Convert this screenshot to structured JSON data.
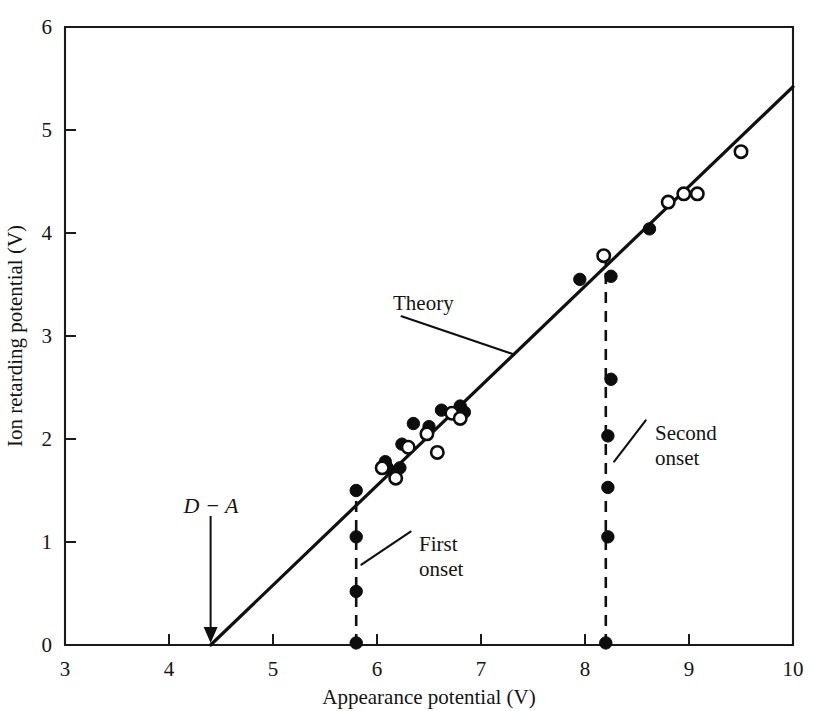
{
  "chart_data": {
    "type": "scatter",
    "title": "",
    "xlabel": "Appearance potential (V)",
    "ylabel": "Ion retarding potential (V)",
    "xlim": [
      3,
      10
    ],
    "ylim": [
      0,
      6
    ],
    "xticks": [
      3,
      4,
      5,
      6,
      7,
      8,
      9,
      10
    ],
    "yticks": [
      0,
      1,
      2,
      3,
      4,
      5,
      6
    ],
    "xtick_labels": [
      "3",
      "4",
      "5",
      "6",
      "7",
      "8",
      "9",
      "10"
    ],
    "ytick_labels": [
      "0",
      "1",
      "2",
      "3",
      "4",
      "5",
      "6"
    ],
    "grid": false,
    "legend": "none",
    "series": [
      {
        "name": "Filled circles",
        "marker": "filled-circle",
        "points": [
          [
            5.8,
            1.5
          ],
          [
            5.8,
            1.05
          ],
          [
            5.8,
            0.52
          ],
          [
            5.8,
            0.02
          ],
          [
            6.08,
            1.78
          ],
          [
            6.1,
            1.72
          ],
          [
            6.22,
            1.72
          ],
          [
            6.24,
            1.95
          ],
          [
            6.35,
            2.15
          ],
          [
            6.5,
            2.12
          ],
          [
            6.62,
            2.28
          ],
          [
            6.8,
            2.32
          ],
          [
            6.84,
            2.26
          ],
          [
            8.25,
            3.58
          ],
          [
            8.25,
            2.58
          ],
          [
            8.22,
            2.03
          ],
          [
            8.22,
            1.53
          ],
          [
            8.22,
            1.05
          ],
          [
            8.2,
            0.02
          ],
          [
            8.62,
            4.04
          ],
          [
            7.95,
            3.55
          ]
        ]
      },
      {
        "name": "Open circles",
        "marker": "open-circle",
        "points": [
          [
            6.05,
            1.72
          ],
          [
            6.18,
            1.62
          ],
          [
            6.3,
            1.92
          ],
          [
            6.48,
            2.05
          ],
          [
            6.58,
            1.87
          ],
          [
            6.72,
            2.25
          ],
          [
            6.8,
            2.2
          ],
          [
            8.18,
            3.78
          ],
          [
            8.8,
            4.3
          ],
          [
            8.95,
            4.38
          ],
          [
            9.08,
            4.38
          ],
          [
            9.5,
            4.79
          ]
        ]
      }
    ],
    "theory_line": {
      "label": "Theory",
      "x_start": 4.4,
      "y_start": 0.0,
      "x_end": 10.0,
      "y_end": 5.42
    },
    "annotations": [
      {
        "name": "theory-label",
        "text": "Theory",
        "x": 6.14,
        "y": 3.23,
        "leader_to_x": 7.32,
        "leader_to_y": 2.82
      },
      {
        "name": "first-onset-label",
        "text_line1": "First",
        "text_line2": "onset",
        "x": 6.4,
        "y": 1.12,
        "leader_to_x": 5.85,
        "leader_to_y": 0.78
      },
      {
        "name": "second-onset-label",
        "text_line1": "Second",
        "text_line2": "onset",
        "x": 8.68,
        "y": 2.2,
        "leader_to_x": 8.28,
        "leader_to_y": 1.78
      },
      {
        "name": "d-minus-a-label",
        "text": "D − A",
        "x": 4.4,
        "y": 1.35,
        "arrow_to_x": 4.4,
        "arrow_to_y": 0.02
      }
    ],
    "onset_lines": [
      {
        "name": "first-onset",
        "x": 5.8,
        "y_bottom": 0.0,
        "y_top": 1.5
      },
      {
        "name": "second-onset",
        "x": 8.2,
        "y_bottom": 0.0,
        "y_top": 3.8
      }
    ]
  },
  "labels": {
    "x_axis_title": "Appearance potential (V)",
    "y_axis_title": "Ion retarding potential (V)",
    "theory": "Theory",
    "first_onset_l1": "First",
    "first_onset_l2": "onset",
    "second_onset_l1": "Second",
    "second_onset_l2": "onset",
    "d_minus_a": "D − A",
    "x_tick_3": "3",
    "x_tick_4": "4",
    "x_tick_5": "5",
    "x_tick_6": "6",
    "x_tick_7": "7",
    "x_tick_8": "8",
    "x_tick_9": "9",
    "x_tick_10": "10",
    "y_tick_0": "0",
    "y_tick_1": "1",
    "y_tick_2": "2",
    "y_tick_3": "3",
    "y_tick_4": "4",
    "y_tick_5": "5",
    "y_tick_6": "6"
  },
  "colors": {
    "ink": "#101010",
    "background": "#ffffff"
  }
}
